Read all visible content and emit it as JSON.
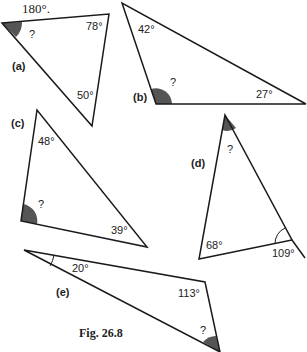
{
  "header_fragment": "180°.",
  "figure_caption": "Fig. 26.8",
  "colors": {
    "line": "#1a1a1a",
    "shade": "#555555",
    "text": "#222222"
  },
  "triangles": [
    {
      "id": "a",
      "label": "(a)",
      "angles": [
        "?",
        "78°",
        "50°"
      ],
      "unknown": "?"
    },
    {
      "id": "b",
      "label": "(b)",
      "angles": [
        "42°",
        "?",
        "27°"
      ],
      "unknown": "?"
    },
    {
      "id": "c",
      "label": "(c)",
      "angles": [
        "48°",
        "?",
        "39°"
      ],
      "unknown": "?"
    },
    {
      "id": "d",
      "label": "(d)",
      "angles": [
        "?",
        "68°",
        "109°"
      ],
      "unknown": "?",
      "note": "109° is exterior angle"
    },
    {
      "id": "e",
      "label": "(e)",
      "angles": [
        "20°",
        "113°",
        "?"
      ],
      "unknown": "?"
    }
  ]
}
